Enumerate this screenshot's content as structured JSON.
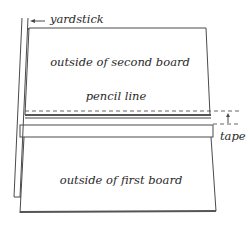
{
  "diagram": {
    "labels": {
      "yardstick": "yardstick",
      "second_board": "outside of second board",
      "pencil_line": "pencil line",
      "tape": "tape",
      "first_board": "outside of first board"
    },
    "parts": [
      {
        "id": "yardstick",
        "description": "straightedge held along the left edge of both boards"
      },
      {
        "id": "second_board",
        "description": "upper board, outside face up"
      },
      {
        "id": "pencil_line",
        "description": "dashed line drawn near the bottom edge of the second board"
      },
      {
        "id": "tape",
        "description": "tape strip spanning the joint between boards"
      },
      {
        "id": "first_board",
        "description": "lower board, outside face up"
      }
    ],
    "colors": {
      "line": "#4a4a4a",
      "text": "#2a2a2a",
      "background": "#ffffff"
    }
  }
}
